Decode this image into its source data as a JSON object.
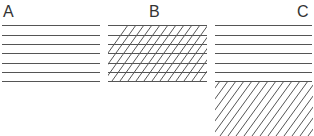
{
  "panels": [
    {
      "label": "A",
      "pattern": "horizontal-lines"
    },
    {
      "label": "B",
      "pattern": "horizontal-lines-with-diagonal-hatch"
    },
    {
      "label": "C",
      "pattern": "horizontal-lines-above-diagonal-hatch"
    }
  ],
  "colors": {
    "line": "#555555",
    "text": "#333333",
    "background": "#ffffff"
  }
}
